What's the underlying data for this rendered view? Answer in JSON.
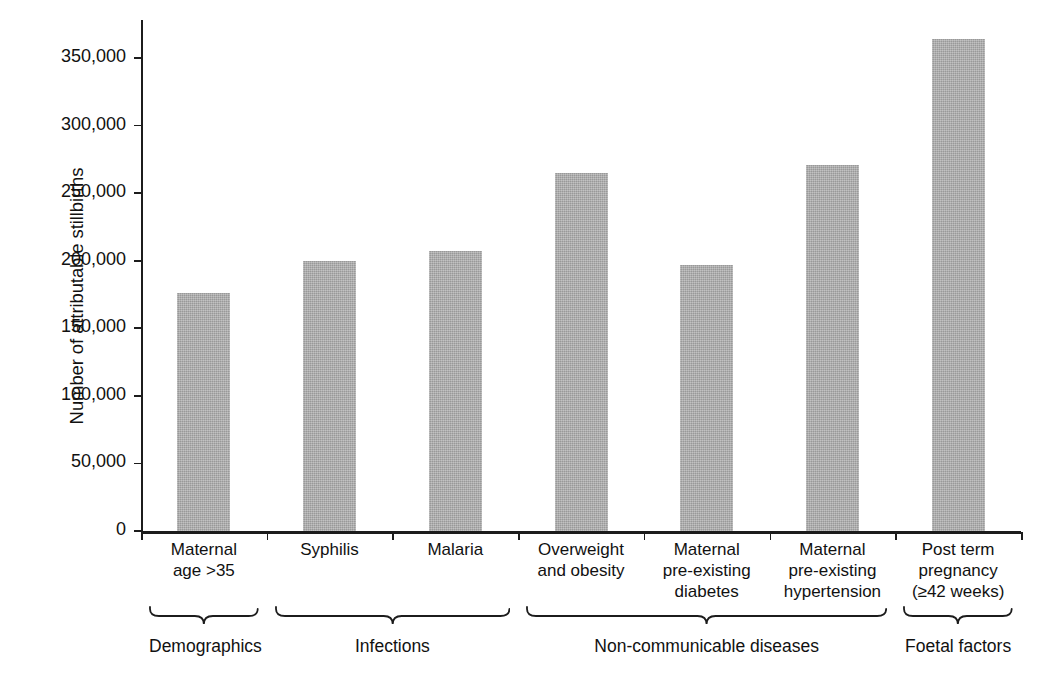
{
  "chart_data": {
    "type": "bar",
    "title": "",
    "xlabel": "",
    "ylabel": "Number of attributable stillbirths",
    "ylim": [
      0,
      370000
    ],
    "grid": false,
    "legend": null,
    "categories": [
      "Maternal\nage >35",
      "Syphilis",
      "Malaria",
      "Overweight\nand obesity",
      "Maternal\npre-existing\ndiabetes",
      "Maternal\npre-existing\nhypertension",
      "Post term\npregnancy\n(≥42 weeks)"
    ],
    "values": [
      176000,
      200000,
      207000,
      265000,
      197000,
      271000,
      364000
    ],
    "bar_color": "#ababab",
    "y_ticks": [
      0,
      50000,
      100000,
      150000,
      200000,
      250000,
      300000,
      350000
    ],
    "y_tick_labels": [
      "0",
      "50,000",
      "100,000",
      "150,000",
      "200,000",
      "250,000",
      "300,000",
      "350,000"
    ]
  },
  "axes": {
    "y_title": "Number of attributable stillbirths"
  },
  "categories": [
    {
      "lines": [
        "Maternal",
        "age >35"
      ]
    },
    {
      "lines": [
        "Syphilis"
      ]
    },
    {
      "lines": [
        "Malaria"
      ]
    },
    {
      "lines": [
        "Overweight",
        "and obesity"
      ]
    },
    {
      "lines": [
        "Maternal",
        "pre-existing",
        "diabetes"
      ]
    },
    {
      "lines": [
        "Maternal",
        "pre-existing",
        "hypertension"
      ]
    },
    {
      "lines": [
        "Post term",
        "pregnancy",
        "(≥42 weeks)"
      ]
    }
  ],
  "groups": [
    {
      "label": "Demographics",
      "first": 0,
      "last": 0
    },
    {
      "label": "Infections",
      "first": 1,
      "last": 2
    },
    {
      "label": "Non-communicable diseases",
      "first": 3,
      "last": 5
    },
    {
      "label": "Foetal factors",
      "first": 6,
      "last": 6
    }
  ]
}
